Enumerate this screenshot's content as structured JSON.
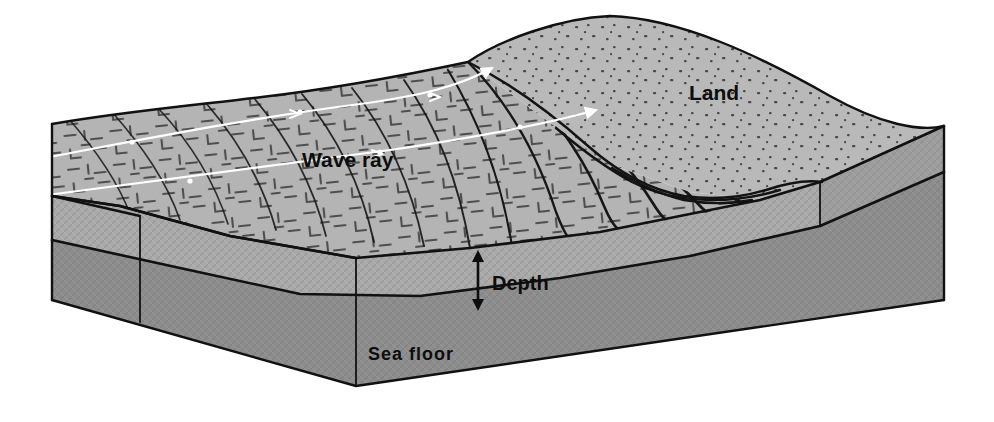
{
  "figure": {
    "kind": "block-diagram",
    "background_color": "#ffffff"
  },
  "labels": {
    "land": "Land",
    "wave_ray": "Wave ray",
    "depth": "Depth",
    "sea_floor": "Sea floor"
  },
  "colors": {
    "water_surface": "#b4b4b4",
    "land_surface": "#b9b9b9",
    "water_front_face": "#a9a9a9",
    "sea_floor_front_face": "#8d8d8d",
    "land_right_face": "#9d9d9d",
    "left_face_water": "#a2a2a2",
    "left_face_floor": "#8a8a8a",
    "outline": "#111111",
    "wave_ray_line": "#ffffff",
    "label_text": "#0d0d0d"
  },
  "geometry": {
    "block_top_back_left": [
      52,
      124
    ],
    "block_top_front_left": [
      52,
      196
    ],
    "block_bottom_front_left": [
      52,
      300
    ],
    "block_front_corner": [
      356,
      386
    ],
    "block_right_corner": [
      944,
      300
    ],
    "block_top_right": [
      944,
      126
    ],
    "depth_arrow": {
      "x": 478,
      "y_top": 253,
      "y_bottom": 308,
      "double_headed": true
    }
  },
  "wave_crests": {
    "count": 12,
    "description": "Dark curved crest lines that bend and shorten as they refract toward the shoreline"
  },
  "wave_rays": {
    "count": 2,
    "color": "#ffffff",
    "description": "White lines with small arrowheads running perpendicular to the wave crests toward shore"
  }
}
